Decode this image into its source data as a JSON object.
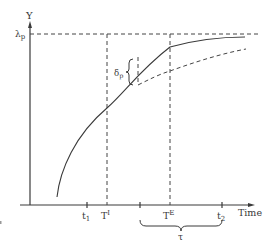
{
  "diagram": {
    "y_axis_label": "Y",
    "x_axis_label": "Time",
    "asymptote_label_main": "λ",
    "asymptote_label_sub": "p",
    "gap_label_main": "δ",
    "gap_label_sub": "p",
    "ticks": [
      {
        "id": "t1",
        "main": "t",
        "sub": "1",
        "x": 87
      },
      {
        "id": "TI",
        "main": "T",
        "sup": "I",
        "x": 107
      },
      {
        "id": "tau_start",
        "main": "",
        "x": 140
      },
      {
        "id": "TE",
        "main": "T",
        "sup": "E",
        "x": 170
      },
      {
        "id": "t2",
        "main": "t",
        "sub": "2",
        "x": 222
      }
    ],
    "interval_label": "τ",
    "colors": {
      "line": "#3a3a3a",
      "background": "#ffffff"
    }
  }
}
